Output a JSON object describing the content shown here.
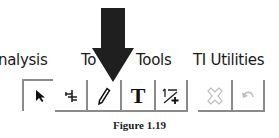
{
  "menu": {
    "tabs": [
      {
        "label": "nalysis"
      },
      {
        "label": "To"
      },
      {
        "label": "Tools"
      },
      {
        "label": "TI Utilities"
      }
    ]
  },
  "toolbar": {
    "buttons": [
      {
        "name": "pointer",
        "icon": "arrow-pointer-icon",
        "selected": true
      },
      {
        "name": "point-on",
        "icon": "point-on-object-icon"
      },
      {
        "name": "pencil",
        "icon": "pencil-icon"
      },
      {
        "name": "text",
        "icon": "text-icon",
        "label": "T"
      },
      {
        "name": "lines",
        "icon": "perpendicular-lines-icon"
      },
      {
        "name": "delete",
        "icon": "delete-x-icon",
        "disabled": true
      },
      {
        "name": "undo",
        "icon": "undo-icon",
        "disabled": true
      }
    ]
  },
  "annotation": {
    "icon": "down-arrow-icon",
    "color": "#1f1f1f"
  },
  "caption": "Figure 1.19"
}
